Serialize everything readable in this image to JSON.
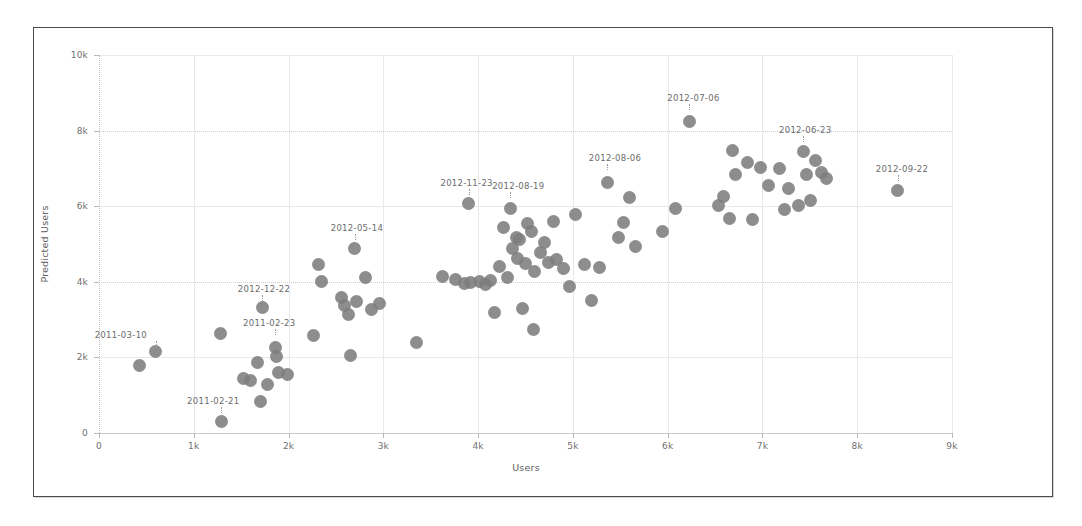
{
  "chart_data": {
    "type": "scatter",
    "title": "",
    "xlabel": "Users",
    "ylabel": "Predicted Users",
    "xlim": [
      0,
      9000
    ],
    "ylim": [
      0,
      10000
    ],
    "grid": true,
    "legend": null,
    "marker": {
      "shape": "circle",
      "color": "#7d7d7d",
      "size": 13
    },
    "x_ticks": [
      {
        "value": 0,
        "label": "0"
      },
      {
        "value": 1000,
        "label": "1k"
      },
      {
        "value": 2000,
        "label": "2k"
      },
      {
        "value": 3000,
        "label": "3k"
      },
      {
        "value": 4000,
        "label": "4k"
      },
      {
        "value": 5000,
        "label": "5k"
      },
      {
        "value": 6000,
        "label": "6k"
      },
      {
        "value": 7000,
        "label": "7k"
      },
      {
        "value": 8000,
        "label": "8k"
      },
      {
        "value": 9000,
        "label": "9k"
      }
    ],
    "y_ticks": [
      {
        "value": 0,
        "label": "0"
      },
      {
        "value": 2000,
        "label": "2k"
      },
      {
        "value": 4000,
        "label": "4k"
      },
      {
        "value": 6000,
        "label": "6k"
      },
      {
        "value": 8000,
        "label": "8k"
      },
      {
        "value": 10000,
        "label": "10k"
      }
    ],
    "points": [
      {
        "x": 430,
        "y": 1780
      },
      {
        "x": 600,
        "y": 2150,
        "label": "2011-03-10",
        "label_dx": -35,
        "label_dy": -22
      },
      {
        "x": 1280,
        "y": 2620
      },
      {
        "x": 1290,
        "y": 300,
        "label": "2011-02-21",
        "label_dx": -8,
        "label_dy": -26
      },
      {
        "x": 1520,
        "y": 1450
      },
      {
        "x": 1600,
        "y": 1400
      },
      {
        "x": 1670,
        "y": 1860
      },
      {
        "x": 1700,
        "y": 830
      },
      {
        "x": 1720,
        "y": 3320,
        "label": "2012-12-22",
        "label_dx": 2,
        "label_dy": -24
      },
      {
        "x": 1780,
        "y": 1270
      },
      {
        "x": 1860,
        "y": 2250,
        "label": "2011-02-23",
        "label_dx": -6,
        "label_dy": -30
      },
      {
        "x": 1870,
        "y": 2020
      },
      {
        "x": 1890,
        "y": 1600
      },
      {
        "x": 1990,
        "y": 1560
      },
      {
        "x": 2260,
        "y": 2590
      },
      {
        "x": 2320,
        "y": 4470
      },
      {
        "x": 2350,
        "y": 4010
      },
      {
        "x": 2560,
        "y": 3590
      },
      {
        "x": 2590,
        "y": 3370
      },
      {
        "x": 2630,
        "y": 3130
      },
      {
        "x": 2650,
        "y": 2060
      },
      {
        "x": 2700,
        "y": 4870,
        "label": "2012-05-14",
        "label_dx": 2,
        "label_dy": -26
      },
      {
        "x": 2720,
        "y": 3490
      },
      {
        "x": 2810,
        "y": 4110
      },
      {
        "x": 2880,
        "y": 3270
      },
      {
        "x": 2960,
        "y": 3420
      },
      {
        "x": 3350,
        "y": 2400
      },
      {
        "x": 3620,
        "y": 4150
      },
      {
        "x": 3760,
        "y": 4060
      },
      {
        "x": 3860,
        "y": 3960
      },
      {
        "x": 3900,
        "y": 6060,
        "label": "2012-11-23",
        "label_dx": -2,
        "label_dy": -26
      },
      {
        "x": 3920,
        "y": 3980
      },
      {
        "x": 4010,
        "y": 4020
      },
      {
        "x": 4080,
        "y": 3930
      },
      {
        "x": 4130,
        "y": 4040
      },
      {
        "x": 4170,
        "y": 3200
      },
      {
        "x": 4230,
        "y": 4400
      },
      {
        "x": 4270,
        "y": 5430
      },
      {
        "x": 4310,
        "y": 4120
      },
      {
        "x": 4340,
        "y": 5930,
        "label": "2012-08-19",
        "label_dx": 8,
        "label_dy": -28
      },
      {
        "x": 4360,
        "y": 4880
      },
      {
        "x": 4400,
        "y": 5170
      },
      {
        "x": 4420,
        "y": 4620
      },
      {
        "x": 4440,
        "y": 5120
      },
      {
        "x": 4470,
        "y": 3290
      },
      {
        "x": 4500,
        "y": 4480
      },
      {
        "x": 4520,
        "y": 5540
      },
      {
        "x": 4560,
        "y": 5330
      },
      {
        "x": 4580,
        "y": 2740
      },
      {
        "x": 4600,
        "y": 4280
      },
      {
        "x": 4660,
        "y": 4780
      },
      {
        "x": 4700,
        "y": 5050
      },
      {
        "x": 4740,
        "y": 4520
      },
      {
        "x": 4800,
        "y": 5600
      },
      {
        "x": 4830,
        "y": 4590
      },
      {
        "x": 4900,
        "y": 4350
      },
      {
        "x": 4960,
        "y": 3870
      },
      {
        "x": 5030,
        "y": 5770
      },
      {
        "x": 5120,
        "y": 4460
      },
      {
        "x": 5200,
        "y": 3500
      },
      {
        "x": 5280,
        "y": 4370
      },
      {
        "x": 5360,
        "y": 6620,
        "label": "2012-08-06",
        "label_dx": 8,
        "label_dy": -30
      },
      {
        "x": 5480,
        "y": 5180
      },
      {
        "x": 5530,
        "y": 5580
      },
      {
        "x": 5600,
        "y": 6230
      },
      {
        "x": 5660,
        "y": 4930
      },
      {
        "x": 5950,
        "y": 5330
      },
      {
        "x": 6080,
        "y": 5930
      },
      {
        "x": 6230,
        "y": 8250,
        "label": "2012-07-06",
        "label_dx": 4,
        "label_dy": -28
      },
      {
        "x": 6540,
        "y": 6030
      },
      {
        "x": 6590,
        "y": 6260
      },
      {
        "x": 6650,
        "y": 5680
      },
      {
        "x": 6680,
        "y": 7480
      },
      {
        "x": 6720,
        "y": 6840
      },
      {
        "x": 6840,
        "y": 7150
      },
      {
        "x": 6900,
        "y": 5650
      },
      {
        "x": 6980,
        "y": 7020
      },
      {
        "x": 7060,
        "y": 6550
      },
      {
        "x": 7180,
        "y": 7000
      },
      {
        "x": 7230,
        "y": 5920
      },
      {
        "x": 7280,
        "y": 6480
      },
      {
        "x": 7380,
        "y": 6020
      },
      {
        "x": 7430,
        "y": 7460,
        "label": "2012-06-23",
        "label_dx": 2,
        "label_dy": -26
      },
      {
        "x": 7470,
        "y": 6840
      },
      {
        "x": 7510,
        "y": 6140
      },
      {
        "x": 7560,
        "y": 7220
      },
      {
        "x": 7620,
        "y": 6880
      },
      {
        "x": 7680,
        "y": 6730
      },
      {
        "x": 8430,
        "y": 6420,
        "label": "2012-09-22",
        "label_dx": 4,
        "label_dy": -26
      }
    ]
  }
}
